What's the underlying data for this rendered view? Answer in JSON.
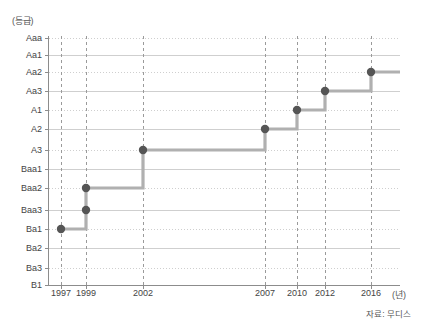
{
  "axis_unit_y": "(등급)",
  "axis_unit_x": "(년)",
  "source_note": "자료: 무디스",
  "colors": {
    "line": "#b0b0b0",
    "marker": "#555555",
    "gridline": "#cfcfcf",
    "dashed": "#9a9a9a",
    "axis": "#8c8c8c",
    "text": "#444444"
  },
  "chart_data": {
    "type": "line",
    "title": "",
    "subtitle": "",
    "xlabel": "(년)",
    "ylabel": "(등급)",
    "grid": true,
    "legend": "none",
    "step": "post",
    "y_categories": [
      "Aaa",
      "Aa1",
      "Aa2",
      "Aa3",
      "A1",
      "A2",
      "A3",
      "Baa1",
      "Baa2",
      "Baa3",
      "Ba1",
      "Ba2",
      "Ba3",
      "B1"
    ],
    "x_ticks": [
      "1997",
      "1999",
      "2002",
      "2007",
      "2010",
      "2012",
      "2016"
    ],
    "xlim": [
      1996,
      2018
    ],
    "series": [
      {
        "name": "무디스 신용등급",
        "points": [
          {
            "x": "1997",
            "y": "Ba1"
          },
          {
            "x": "1999",
            "y": "Baa3"
          },
          {
            "x": "1999",
            "y": "Baa2"
          },
          {
            "x": "2002",
            "y": "A3"
          },
          {
            "x": "2007",
            "y": "A2"
          },
          {
            "x": "2010",
            "y": "A1"
          },
          {
            "x": "2012",
            "y": "Aa3"
          },
          {
            "x": "2016",
            "y": "Aa2"
          }
        ]
      }
    ]
  },
  "y_axis": {
    "ticks": [
      {
        "label": "Aaa",
        "y": 38
      },
      {
        "label": "Aa1",
        "y": 55
      },
      {
        "label": "Aa2",
        "y": 72
      },
      {
        "label": "Aa3",
        "y": 91
      },
      {
        "label": "A1",
        "y": 110
      },
      {
        "label": "A2",
        "y": 129
      },
      {
        "label": "A3",
        "y": 150
      },
      {
        "label": "Baa1",
        "y": 169
      },
      {
        "label": "Baa2",
        "y": 188
      },
      {
        "label": "Baa3",
        "y": 210
      },
      {
        "label": "Ba1",
        "y": 229
      },
      {
        "label": "Ba2",
        "y": 248
      },
      {
        "label": "Ba3",
        "y": 268
      },
      {
        "label": "B1",
        "y": 285
      }
    ]
  },
  "x_axis": {
    "ticks": [
      {
        "label": "1997",
        "x": 61
      },
      {
        "label": "1999",
        "x": 86
      },
      {
        "label": "2002",
        "x": 143
      },
      {
        "label": "2007",
        "x": 265
      },
      {
        "label": "2010",
        "x": 297
      },
      {
        "label": "2012",
        "x": 325
      },
      {
        "label": "2016",
        "x": 371
      }
    ]
  }
}
